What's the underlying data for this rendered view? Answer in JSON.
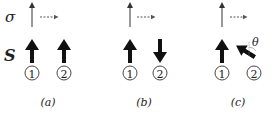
{
  "row_labels": {
    "sigma": "σ",
    "spin": "S"
  },
  "panels": [
    {
      "id": "a",
      "caption": "(a)",
      "particle1": "1",
      "particle2": "2",
      "spin1": "up",
      "spin2": "up"
    },
    {
      "id": "b",
      "caption": "(b)",
      "particle1": "1",
      "particle2": "2",
      "spin1": "up",
      "spin2": "down"
    },
    {
      "id": "c",
      "caption": "(c)",
      "particle1": "1",
      "particle2": "2",
      "spin1": "up",
      "spin2": "tilted",
      "angle_label": "θ"
    }
  ],
  "colors": {
    "ink": "#1a1a1a",
    "dashed": "#555555"
  }
}
